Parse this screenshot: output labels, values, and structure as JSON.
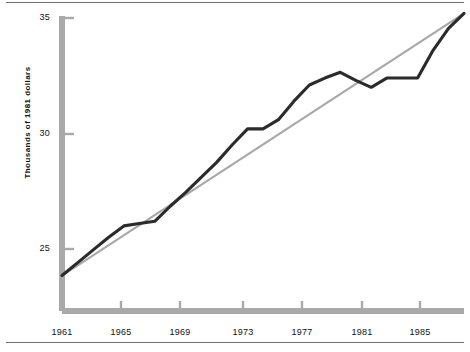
{
  "chart_data": {
    "type": "line",
    "title": "",
    "subtitle": "",
    "xlabel": "",
    "ylabel": "Thousands of 1981 dollars",
    "xlim": [
      1961,
      1987
    ],
    "ylim": [
      23.8,
      35.4
    ],
    "grid": false,
    "legend": null,
    "x_ticks": [
      1961,
      1965,
      1969,
      1973,
      1977,
      1981,
      1985
    ],
    "x_tick_labels": [
      "1961",
      "1965",
      "1969",
      "1973",
      "1977",
      "1981",
      "1985"
    ],
    "y_ticks": [
      25,
      30,
      35
    ],
    "y_tick_labels": [
      "25",
      "30",
      "35"
    ],
    "series": [
      {
        "name": "actual",
        "style": "solid-dark",
        "color": "#2b2b2b",
        "x": [
          1961,
          1962,
          1963,
          1964,
          1965,
          1966,
          1967,
          1968,
          1969,
          1970,
          1971,
          1972,
          1973,
          1974,
          1975,
          1976,
          1977,
          1978,
          1979,
          1980,
          1981,
          1982,
          1983,
          1984,
          1985,
          1986,
          1987
        ],
        "values": [
          23.85,
          24.4,
          24.95,
          25.5,
          26.0,
          26.1,
          26.2,
          26.85,
          27.45,
          28.1,
          28.75,
          29.5,
          30.2,
          30.2,
          30.6,
          31.4,
          32.1,
          32.4,
          32.65,
          32.3,
          32.0,
          32.4,
          32.4,
          32.4,
          33.6,
          34.55,
          35.2
        ]
      },
      {
        "name": "trend",
        "style": "solid-light",
        "color": "#a8a8a8",
        "x": [
          1961,
          1987
        ],
        "values": [
          23.85,
          35.2
        ]
      }
    ],
    "annotations": []
  },
  "axes": {
    "y_axis_name": "value-axis",
    "x_axis_name": "year-axis",
    "axis_color": "#a0a0a0"
  }
}
